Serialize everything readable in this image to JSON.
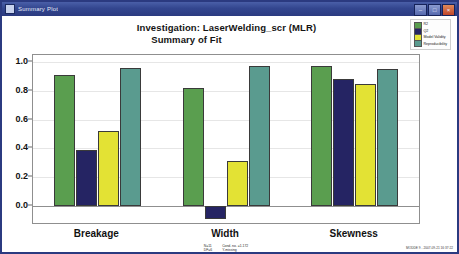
{
  "window": {
    "title": "Summary Plot",
    "icon": "plot-window-icon",
    "buttons": [
      {
        "name": "minimize",
        "glyph": "–"
      },
      {
        "name": "maximize",
        "glyph": "□"
      },
      {
        "name": "close",
        "glyph": "×"
      }
    ]
  },
  "header": {
    "line1": "Investigation: LaserWelding_scr (MLR)",
    "line2": "Summary of Fit"
  },
  "legend": {
    "position": "top-right",
    "entries": [
      {
        "label": "R2",
        "color": "#5a9e4f"
      },
      {
        "label": "Q2",
        "color": "#252463"
      },
      {
        "label": "Model Validity",
        "color": "#e3e234"
      },
      {
        "label": "Reproducibility",
        "color": "#5a9b8f"
      }
    ]
  },
  "footnote": {
    "left": "N=11\nDF=6",
    "center": "Cond. no. =1.172\nY-missing",
    "stamp": "MODDE 9 - 2007-09-21 16:37:22"
  },
  "chart_data": {
    "type": "bar",
    "title": "Summary of Fit",
    "subtitle": "Investigation: LaserWelding_scr (MLR)",
    "xlabel": "",
    "ylabel": "",
    "categories": [
      "Breakage",
      "Width",
      "Skewness"
    ],
    "ylim": [
      -0.12,
      1.05
    ],
    "yticks": [
      0.0,
      0.2,
      0.4,
      0.6,
      0.8,
      1.0
    ],
    "ytick_labels": [
      "0.0",
      "0.2",
      "0.4",
      "0.6",
      "0.8",
      "1.0"
    ],
    "grid": true,
    "legend_position": "top-right",
    "series": [
      {
        "name": "R2",
        "color": "#5a9e4f",
        "values": [
          0.91,
          0.82,
          0.97
        ]
      },
      {
        "name": "Q2",
        "color": "#252463",
        "values": [
          0.39,
          -0.09,
          0.88
        ]
      },
      {
        "name": "Model Validity",
        "color": "#e3e234",
        "values": [
          0.52,
          0.31,
          0.85
        ]
      },
      {
        "name": "Reproducibility",
        "color": "#5a9b8f",
        "values": [
          0.96,
          0.97,
          0.95
        ]
      }
    ]
  }
}
